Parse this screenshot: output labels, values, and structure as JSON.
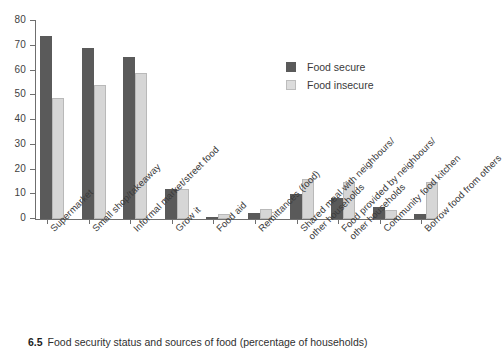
{
  "caption": {
    "number": "6.5",
    "text": "Food security status and sources of food (percentage of households)"
  },
  "legend": {
    "position": "inside-top-right",
    "entries": [
      {
        "label": "Food secure",
        "color": "#5a5a5a"
      },
      {
        "label": "Food insecure",
        "color": "#d6d6d6"
      }
    ]
  },
  "axis": {
    "y_ticks": [
      "0",
      "10",
      "20",
      "30",
      "40",
      "50",
      "60",
      "70",
      "80"
    ]
  },
  "chart_data": {
    "type": "bar",
    "title": "Food security status and sources of food (percentage of households)",
    "xlabel": "",
    "ylabel": "",
    "ylim": [
      0,
      80
    ],
    "ytick_step": 10,
    "grid": false,
    "legend_position": "inside-top-right",
    "categories": [
      "Supermarket",
      "Small shop/takeaway",
      "Informal market/street food",
      "Grow it",
      "Food aid",
      "Remittances (food)",
      "Shared meal with neighbours/\nother households",
      "Food provided by neighbours/\nother households",
      "Community food kitchen",
      "Borrow food from others"
    ],
    "series": [
      {
        "name": "Food secure",
        "color": "#5a5a5a",
        "values": [
          74,
          69,
          65.5,
          12,
          1,
          2.5,
          10,
          8.5,
          5,
          2
        ]
      },
      {
        "name": "Food insecure",
        "color": "#d6d6d6",
        "values": [
          49,
          54,
          59,
          12,
          2,
          4,
          16,
          15,
          3.5,
          15
        ]
      }
    ]
  }
}
